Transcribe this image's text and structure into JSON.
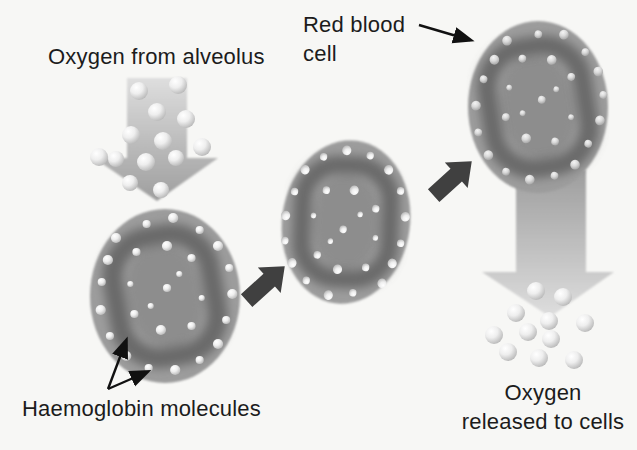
{
  "labels": {
    "oxygen_from_alveolus": "Oxygen from alveolus",
    "red_blood_cell": "Red blood\ncell",
    "haemoglobin_molecules": "Haemoglobin molecules",
    "oxygen_released_to_cells": "Oxygen\nreleased to cells"
  },
  "colors": {
    "background": "#f7f7f5",
    "text": "#1c1c1c",
    "cell_body": "#9c9c9c",
    "cell_ring": "#6a6a6a",
    "cell_center": "#8d8d8d",
    "dark_arrow": "#404040",
    "label_arrow": "#111111",
    "flow_arrow_light": "#dedede",
    "flow_arrow_dark": "#9e9e9e",
    "sphere_highlight": "#ffffff",
    "sphere_mid": "#eeeeee",
    "sphere_edge": "#b0b0b0",
    "sphere_dim_highlight": "#f4f4f4",
    "sphere_dim_mid": "#dadada",
    "sphere_dim_edge": "#9d9d9d"
  },
  "figure": {
    "type": "diagram",
    "cell_dot_pattern": [
      [
        -48,
        -58,
        5
      ],
      [
        -18,
        -72,
        4
      ],
      [
        8,
        -78,
        5
      ],
      [
        34,
        -66,
        4
      ],
      [
        52,
        -50,
        5
      ],
      [
        63,
        -28,
        4
      ],
      [
        66,
        -2,
        5
      ],
      [
        60,
        24,
        4
      ],
      [
        52,
        48,
        5
      ],
      [
        34,
        64,
        4
      ],
      [
        10,
        74,
        5
      ],
      [
        -16,
        72,
        4
      ],
      [
        -38,
        60,
        5
      ],
      [
        -54,
        40,
        4
      ],
      [
        -63,
        14,
        5
      ],
      [
        -62,
        -14,
        4
      ],
      [
        -56,
        -36,
        5
      ],
      [
        -28,
        -44,
        4
      ],
      [
        2,
        -50,
        5
      ],
      [
        26,
        -38,
        4
      ],
      [
        -34,
        -12,
        3
      ],
      [
        -30,
        18,
        4
      ],
      [
        -4,
        34,
        5
      ],
      [
        26,
        30,
        4
      ],
      [
        36,
        2,
        3
      ],
      [
        2,
        -8,
        4
      ],
      [
        -14,
        10,
        3
      ],
      [
        14,
        -22,
        3
      ]
    ],
    "inflow_spheres": [
      [
        139,
        91,
        9
      ],
      [
        178,
        85,
        9
      ],
      [
        157,
        112,
        9
      ],
      [
        186,
        119,
        9
      ],
      [
        131,
        135,
        9
      ],
      [
        163,
        141,
        9
      ],
      [
        202,
        147,
        9
      ],
      [
        99,
        157,
        9
      ],
      [
        116,
        159,
        8
      ],
      [
        146,
        162,
        9
      ],
      [
        176,
        158,
        8
      ],
      [
        130,
        183,
        8
      ],
      [
        161,
        190,
        8
      ]
    ],
    "outflow_spheres": [
      [
        536,
        291,
        9
      ],
      [
        563,
        297,
        9
      ],
      [
        516,
        313,
        9
      ],
      [
        549,
        321,
        9
      ],
      [
        585,
        323,
        9
      ],
      [
        494,
        335,
        9
      ],
      [
        528,
        332,
        9
      ],
      [
        551,
        339,
        9
      ],
      [
        508,
        352,
        9
      ],
      [
        539,
        358,
        9
      ],
      [
        574,
        360,
        9
      ]
    ]
  }
}
